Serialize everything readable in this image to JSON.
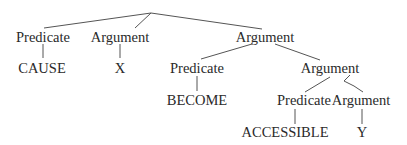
{
  "diagram": {
    "type": "syntax-tree",
    "nodes": {
      "n1": {
        "label": "Predicate"
      },
      "n2": {
        "label": "Argument"
      },
      "n3": {
        "label": "Argument"
      },
      "n4": {
        "label": "CAUSE"
      },
      "n5": {
        "label": "X"
      },
      "n6": {
        "label": "Predicate"
      },
      "n7": {
        "label": "Argument"
      },
      "n8": {
        "label": "BECOME"
      },
      "n9": {
        "label": "Predicate"
      },
      "n10": {
        "label": "Argument"
      },
      "n11": {
        "label": "ACCESSIBLE"
      },
      "n12": {
        "label": "Y"
      }
    },
    "edges": [
      [
        "root",
        "n1"
      ],
      [
        "root",
        "n2"
      ],
      [
        "root",
        "n3"
      ],
      [
        "n1",
        "n4"
      ],
      [
        "n2",
        "n5"
      ],
      [
        "n3",
        "n6"
      ],
      [
        "n3",
        "n7"
      ],
      [
        "n6",
        "n8"
      ],
      [
        "n7",
        "n9"
      ],
      [
        "n7",
        "n10"
      ],
      [
        "n9",
        "n11"
      ],
      [
        "n10",
        "n12"
      ]
    ]
  }
}
